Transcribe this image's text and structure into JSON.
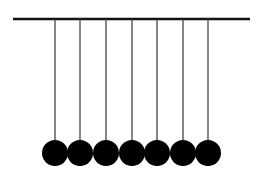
{
  "diagram": {
    "colors": {
      "background": "#ffffff",
      "bar": "#111111",
      "string": "#444444",
      "ball": "#000000"
    },
    "bar": {
      "x1": 13,
      "x2": 250,
      "y": 19,
      "thickness": 2.5
    },
    "string_bottom_y": 141,
    "ball_center_y": 153,
    "ball_radius": 13,
    "pendulums": [
      {
        "x": 55
      },
      {
        "x": 80
      },
      {
        "x": 106
      },
      {
        "x": 132
      },
      {
        "x": 157
      },
      {
        "x": 183
      },
      {
        "x": 208
      }
    ]
  }
}
